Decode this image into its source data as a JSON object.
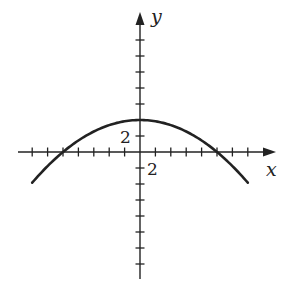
{
  "chart_data": {
    "type": "line",
    "title": "",
    "xlabel": "x",
    "ylabel": "y",
    "tick_labels": {
      "x": "2",
      "y": "2"
    },
    "tick_step": 2,
    "xlim": [
      -14,
      16
    ],
    "ylim": [
      -17,
      18
    ],
    "grid": false,
    "legend": null,
    "series": [
      {
        "name": "parabola",
        "equation": "y = 4 - x^2/25",
        "vertex": [
          0,
          4
        ],
        "x_intercepts": [
          -10,
          10
        ],
        "x": [
          -14,
          -12,
          -10,
          -8,
          -6,
          -4,
          -2,
          0,
          2,
          4,
          6,
          8,
          10,
          12,
          14
        ],
        "values": [
          -3.84,
          -1.76,
          0,
          1.44,
          2.56,
          3.36,
          3.84,
          4,
          3.84,
          3.36,
          2.56,
          1.44,
          0,
          -1.76,
          -3.84
        ]
      }
    ]
  },
  "colors": {
    "axis": "#222222",
    "curve": "#222222",
    "background": "#ffffff"
  }
}
